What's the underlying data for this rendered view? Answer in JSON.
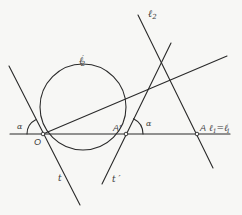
{
  "diagram": {
    "type": "geometric-construction",
    "labels": {
      "l2": "ℓ",
      "l2_sub": "2",
      "l2prime": "ℓ",
      "l2prime_sub": "2",
      "l2prime_mark": "′",
      "l1_eq": "ℓ",
      "l1_sub": "1",
      "l1_equals": "=ℓ",
      "l1prime_sub": "1",
      "l1prime_mark": "′",
      "alpha_left": "α",
      "alpha_right": "α",
      "point_O": "O",
      "point_A_prime": "A′",
      "point_A": "A",
      "line_t": "t",
      "line_t_prime": "t ′"
    },
    "points": {
      "O": [
        43,
        134
      ],
      "A_prime": [
        126,
        134
      ],
      "A": [
        197,
        134
      ]
    },
    "circle": {
      "name": "ℓ2′",
      "center": [
        83,
        107
      ],
      "radius": 43
    },
    "lines": [
      {
        "name": "ℓ1=ℓ1′",
        "from": [
          10,
          134
        ],
        "to": [
          230,
          134
        ]
      },
      {
        "name": "t",
        "from": [
          9,
          66
        ],
        "to": [
          80,
          205
        ]
      },
      {
        "name": "ray-from-O",
        "from": [
          43,
          134
        ],
        "to": [
          227,
          56
        ]
      },
      {
        "name": "t′",
        "from": [
          171,
          43
        ],
        "to": [
          102,
          184
        ]
      },
      {
        "name": "ℓ2",
        "from": [
          138,
          15
        ],
        "to": [
          213,
          168
        ]
      }
    ],
    "colors": {
      "stroke": "#2a2a2a",
      "background": "#f7f7f5",
      "text": "#3a3a3a"
    }
  }
}
